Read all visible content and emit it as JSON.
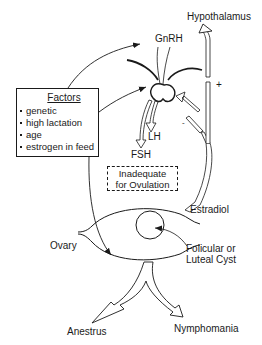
{
  "diagram": {
    "type": "physiology-flow",
    "labels": {
      "hypothalamus": "Hypothalamus",
      "gnrh": "GnRH",
      "lh": "LH",
      "fsh": "FSH",
      "estradiol": "Estradiol",
      "ovary": "Ovary",
      "cyst_line1": "Folicular or",
      "cyst_line2": "Luteal Cyst",
      "anestrus": "Anestrus",
      "nymphomania": "Nymphomania",
      "plus_sign": "+",
      "minus_sign": "-"
    },
    "factors": {
      "title": "Factors",
      "items": [
        "genetic",
        "high lactation",
        "age",
        "estrogen in feed"
      ]
    },
    "inadequate_box": {
      "line1": "Inadequate",
      "line2": "for Ovulation"
    },
    "colors": {
      "stroke": "#1a1a1a",
      "background": "#ffffff"
    }
  }
}
